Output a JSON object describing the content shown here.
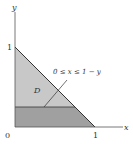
{
  "diagram": {
    "axes": {
      "x_label": "x",
      "y_label": "y",
      "origin_label": "0",
      "x_tick_label": "1",
      "y_tick_label": "1"
    },
    "region": {
      "name": "D",
      "annotation": "0 ≤ x ≤ 1 − y"
    },
    "colors": {
      "region_light": "#c8c8c8",
      "strip_dark": "#a0a0a0",
      "line": "#333333",
      "axis": "#555555"
    }
  }
}
